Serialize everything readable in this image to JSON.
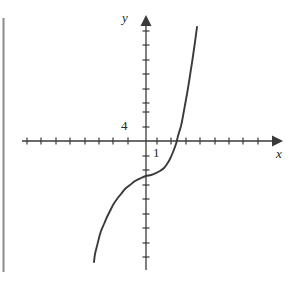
{
  "figure": {
    "background_color": "#ffffff",
    "ink_color": "#3a3a3a",
    "text_color": "#262626",
    "width": 297,
    "height": 290
  },
  "axes": {
    "x_label": "x",
    "y_label": "y",
    "origin_px": {
      "x": 146,
      "y": 141
    },
    "unit_px": 14.5,
    "x_axis_px": {
      "start": 22,
      "end": 276
    },
    "y_axis_px": {
      "top": 16,
      "bottom": 270
    },
    "x_ticks_px": [
      27,
      41,
      56,
      70,
      85,
      99,
      113,
      128,
      157,
      171,
      186,
      200,
      215,
      229,
      243,
      258
    ],
    "y_ticks_px": [
      31,
      45,
      60,
      74,
      89,
      103,
      112,
      127,
      156,
      170,
      185,
      199,
      214,
      228,
      243,
      257
    ],
    "tick_labels": [
      {
        "text": "4",
        "axis": "y",
        "value": 4
      },
      {
        "text": "1",
        "axis": "x",
        "value": 1
      }
    ]
  },
  "artifacts": {
    "page_edge_line": {
      "x_px": 3,
      "y_start_px": 18,
      "y_end_px": 272,
      "color": "#8a8a8a"
    }
  },
  "chart_data": {
    "type": "line",
    "title": "",
    "xlabel": "x",
    "ylabel": "y",
    "grid": false,
    "legend": null,
    "xlim": [
      -8.6,
      9.0
    ],
    "ylim": [
      -8.9,
      8.6
    ],
    "axis_tick_step": 1,
    "labeled_ticks": {
      "x": [
        1
      ],
      "y": [
        4
      ]
    },
    "inflection_point": {
      "x": 0,
      "y": -2
    },
    "x_intercept": {
      "x": 1.4,
      "y": 0
    },
    "y_intercept": {
      "x": 0,
      "y": -2
    },
    "series": [
      {
        "name": "cubic",
        "points_px": [
          [
            94,
            262
          ],
          [
            95,
            254
          ],
          [
            97,
            246
          ],
          [
            99,
            238
          ],
          [
            101,
            231
          ],
          [
            104,
            224
          ],
          [
            107,
            217
          ],
          [
            110,
            211
          ],
          [
            113,
            205
          ],
          [
            117,
            199
          ],
          [
            121,
            194
          ],
          [
            125,
            189
          ],
          [
            130,
            185
          ],
          [
            135,
            181
          ],
          [
            141,
            178
          ],
          [
            146,
            176
          ],
          [
            151,
            175
          ],
          [
            156,
            173
          ],
          [
            160,
            171
          ],
          [
            164,
            168
          ],
          [
            167,
            164
          ],
          [
            170,
            159
          ],
          [
            173,
            152
          ],
          [
            176,
            144
          ],
          [
            178,
            136
          ],
          [
            181,
            126
          ],
          [
            183,
            116
          ],
          [
            185,
            105
          ],
          [
            187,
            94
          ],
          [
            189,
            82
          ],
          [
            191,
            69
          ],
          [
            193,
            56
          ],
          [
            195,
            42
          ],
          [
            197,
            27
          ]
        ],
        "points_data": [
          [
            -3.6,
            -8.3
          ],
          [
            -3.5,
            -7.8
          ],
          [
            -3.4,
            -7.2
          ],
          [
            -3.2,
            -6.7
          ],
          [
            -3.1,
            -6.2
          ],
          [
            -2.9,
            -5.7
          ],
          [
            -2.7,
            -5.2
          ],
          [
            -2.5,
            -4.8
          ],
          [
            -2.3,
            -4.4
          ],
          [
            -2.0,
            -4.0
          ],
          [
            -1.7,
            -3.7
          ],
          [
            -1.4,
            -3.3
          ],
          [
            -1.1,
            -3.0
          ],
          [
            -0.8,
            -2.8
          ],
          [
            -0.3,
            -2.6
          ],
          [
            0.0,
            -2.4
          ],
          [
            0.3,
            -2.3
          ],
          [
            0.7,
            -2.2
          ],
          [
            1.0,
            -2.1
          ],
          [
            1.2,
            -1.9
          ],
          [
            1.4,
            -1.6
          ],
          [
            1.7,
            -1.2
          ],
          [
            1.9,
            -0.8
          ],
          [
            2.1,
            -0.2
          ],
          [
            2.2,
            0.3
          ],
          [
            2.4,
            1.0
          ],
          [
            2.6,
            1.7
          ],
          [
            2.7,
            2.5
          ],
          [
            2.8,
            3.2
          ],
          [
            3.0,
            4.1
          ],
          [
            3.1,
            5.0
          ],
          [
            3.2,
            5.9
          ],
          [
            3.4,
            6.8
          ],
          [
            3.5,
            7.9
          ]
        ]
      }
    ]
  }
}
